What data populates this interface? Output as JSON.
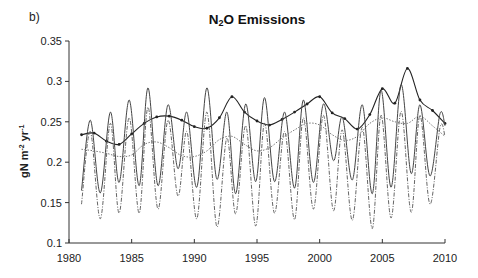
{
  "panel_label": "b)",
  "title_main": "N",
  "title_sub": "2",
  "title_rest": "O Emissions",
  "ylabel_text": "gN m",
  "ylabel_sup1": "-2",
  "ylabel_mid": " yr",
  "ylabel_sup2": "-1",
  "chart_data": {
    "type": "line",
    "title": "N2O Emissions",
    "xlabel": "",
    "ylabel": "gN m-2 yr-1",
    "xlim": [
      1980,
      2010
    ],
    "ylim": [
      0.1,
      0.35
    ],
    "xticks": [
      1980,
      1985,
      1990,
      1995,
      2000,
      2005,
      2010
    ],
    "yticks": [
      0.1,
      0.15,
      0.2,
      0.25,
      0.3,
      0.35
    ],
    "ytick_labels": [
      "0.1",
      "0.15",
      "0.2",
      "0.25",
      "0.3",
      "0.35"
    ],
    "grid": false,
    "legend": "none",
    "series": [
      {
        "name": "solid-with-markers",
        "style": "solid-markers",
        "x": [
          1981,
          1982,
          1983,
          1984,
          1985,
          1986,
          1987,
          1988,
          1989,
          1990,
          1991,
          1992,
          1993,
          1994,
          1995,
          1996,
          1997,
          1998,
          1999,
          2000,
          2001,
          2002,
          2003,
          2004,
          2005,
          2006,
          2007,
          2008,
          2009,
          2010
        ],
        "y": [
          0.234,
          0.236,
          0.226,
          0.222,
          0.235,
          0.248,
          0.256,
          0.257,
          0.252,
          0.244,
          0.242,
          0.255,
          0.281,
          0.262,
          0.251,
          0.246,
          0.253,
          0.262,
          0.272,
          0.281,
          0.261,
          0.254,
          0.241,
          0.259,
          0.291,
          0.273,
          0.316,
          0.277,
          0.264,
          0.248
        ]
      },
      {
        "name": "solid-oscillating",
        "style": "solid",
        "x": [
          1981,
          1981.7,
          1982.5,
          1983.3,
          1984,
          1984.8,
          1985.6,
          1986.3,
          1987.1,
          1987.9,
          1988.7,
          1989.4,
          1990.2,
          1991,
          1991.8,
          1992.6,
          1993.3,
          1994.1,
          1994.9,
          1995.6,
          1996.4,
          1997.2,
          1998,
          1998.7,
          1999.5,
          2000.3,
          2001.1,
          2001.8,
          2002.6,
          2003.4,
          2004.2,
          2004.9,
          2005.7,
          2006.5,
          2007.3,
          2008,
          2008.8,
          2009.6,
          2010
        ],
        "y": [
          0.165,
          0.252,
          0.162,
          0.262,
          0.175,
          0.277,
          0.171,
          0.292,
          0.171,
          0.271,
          0.192,
          0.262,
          0.169,
          0.292,
          0.179,
          0.262,
          0.161,
          0.272,
          0.176,
          0.28,
          0.176,
          0.262,
          0.168,
          0.277,
          0.175,
          0.272,
          0.202,
          0.256,
          0.178,
          0.271,
          0.161,
          0.289,
          0.169,
          0.296,
          0.186,
          0.271,
          0.183,
          0.26,
          0.245
        ]
      },
      {
        "name": "dash-dot-oscillating",
        "style": "dash-dot",
        "x": [
          1981,
          1981.7,
          1982.5,
          1983.3,
          1984,
          1984.8,
          1985.6,
          1986.3,
          1987.1,
          1987.9,
          1988.7,
          1989.4,
          1990.2,
          1991,
          1991.8,
          1992.6,
          1993.3,
          1994.1,
          1994.9,
          1995.6,
          1996.4,
          1997.2,
          1998,
          1998.7,
          1999.5,
          2000.3,
          2001.1,
          2001.8,
          2002.6,
          2003.4,
          2004.2,
          2004.9,
          2005.7,
          2006.5,
          2007.3,
          2008,
          2008.8,
          2009.6,
          2010
        ],
        "y": [
          0.148,
          0.238,
          0.13,
          0.248,
          0.137,
          0.255,
          0.137,
          0.268,
          0.142,
          0.252,
          0.158,
          0.238,
          0.13,
          0.262,
          0.12,
          0.23,
          0.136,
          0.245,
          0.121,
          0.248,
          0.137,
          0.238,
          0.129,
          0.255,
          0.142,
          0.258,
          0.14,
          0.24,
          0.128,
          0.243,
          0.118,
          0.258,
          0.131,
          0.263,
          0.138,
          0.258,
          0.148,
          0.243,
          0.232
        ]
      },
      {
        "name": "dotted-smooth",
        "style": "dotted",
        "x": [
          1981,
          1982,
          1983,
          1984,
          1985,
          1986,
          1987,
          1988,
          1989,
          1990,
          1991,
          1992,
          1993,
          1994,
          1995,
          1996,
          1997,
          1998,
          1999,
          2000,
          2001,
          2002,
          2003,
          2004,
          2005,
          2006,
          2007,
          2008,
          2009,
          2010
        ],
        "y": [
          0.216,
          0.214,
          0.211,
          0.207,
          0.209,
          0.222,
          0.225,
          0.218,
          0.208,
          0.207,
          0.214,
          0.228,
          0.232,
          0.222,
          0.214,
          0.218,
          0.23,
          0.24,
          0.248,
          0.246,
          0.234,
          0.227,
          0.232,
          0.248,
          0.255,
          0.25,
          0.248,
          0.257,
          0.245,
          0.232
        ]
      }
    ]
  }
}
